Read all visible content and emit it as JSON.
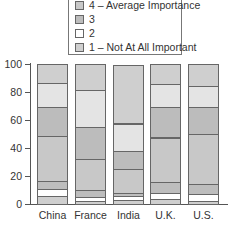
{
  "legend": {
    "items": [
      {
        "label": "4 – Average Importance",
        "color": "#c8c8c8"
      },
      {
        "label": "3",
        "color": "#bdbdbd"
      },
      {
        "label": "2",
        "color": "#ffffff"
      },
      {
        "label": "1 – Not At All Important",
        "color": "#cfcfcf"
      }
    ]
  },
  "yticks": [
    "100",
    "80",
    "60",
    "40",
    "20",
    "0"
  ],
  "chart_data": {
    "type": "bar",
    "stacked": true,
    "title": "",
    "xlabel": "",
    "ylabel": "",
    "ylim": [
      0,
      100
    ],
    "yticks": [
      0,
      20,
      40,
      60,
      80,
      100
    ],
    "categories": [
      "China",
      "France",
      "India",
      "U.K.",
      "U.S."
    ],
    "legend_visible": [
      "4 – Average Importance",
      "3",
      "2",
      "1 – Not At All Important"
    ],
    "series": [
      {
        "name": "1 – Not At All Important",
        "color": "#cfcfcf",
        "values": [
          6,
          2,
          3,
          3.5,
          2
        ]
      },
      {
        "name": "2",
        "color": "#ffffff",
        "values": [
          4.5,
          3,
          2.5,
          4.5,
          5
        ]
      },
      {
        "name": "3",
        "color": "#bdbdbd",
        "values": [
          6,
          5,
          2.5,
          8,
          7
        ]
      },
      {
        "name": "4 – Average Importance",
        "color": "#c8c8c8",
        "values": [
          32,
          22,
          17,
          31.5,
          36
        ]
      },
      {
        "name": "5",
        "color": "#bcbcbc",
        "values": [
          20.5,
          23,
          13,
          22,
          19
        ]
      },
      {
        "name": "6",
        "color": "#e4e4e4",
        "values": [
          17.5,
          26.5,
          19.5,
          16,
          15
        ]
      },
      {
        "name": "7",
        "color": "#cfcfcf",
        "values": [
          13.5,
          18.5,
          42,
          14.5,
          16
        ]
      }
    ]
  }
}
